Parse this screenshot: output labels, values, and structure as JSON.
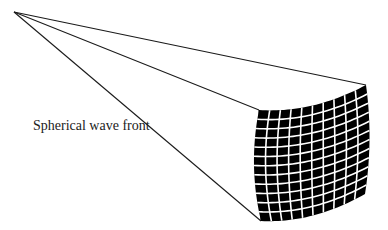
{
  "diagram": {
    "title": "",
    "label": {
      "text": "Spherical wave front",
      "x": 33,
      "y": 118
    },
    "colors": {
      "line": "#1a1a1a",
      "cell": "#000000",
      "gridline": "#ffffff",
      "background": "#ffffff",
      "text": "#222222"
    },
    "apex": {
      "x": 14,
      "y": 12
    },
    "wavefront": {
      "corners": {
        "top_left": {
          "x": 259,
          "y": 110
        },
        "top_right": {
          "x": 366,
          "y": 85
        },
        "bottom_right": {
          "x": 365,
          "y": 194
        },
        "bottom_left": {
          "x": 261,
          "y": 221
        }
      },
      "columns": 10,
      "rows": 12,
      "top_bulge": 8,
      "bottom_bulge": 8,
      "left_bulge": -6,
      "right_bulge": 4
    },
    "rays": [
      {
        "name": "ray-to-top-right",
        "to": "top_right"
      },
      {
        "name": "ray-to-top-left",
        "to": "top_left"
      },
      {
        "name": "ray-to-bottom-left",
        "to": "bottom_left"
      }
    ]
  }
}
